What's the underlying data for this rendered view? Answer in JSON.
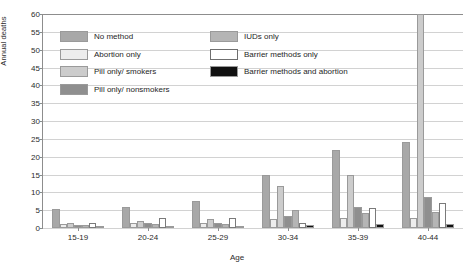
{
  "chart_data": {
    "type": "bar",
    "title": "",
    "xlabel": "Age",
    "ylabel": "Annual deaths",
    "ylim": [
      0,
      60
    ],
    "yticks": [
      0,
      5,
      10,
      15,
      20,
      25,
      30,
      35,
      40,
      45,
      50,
      55,
      60
    ],
    "grid": true,
    "legend_position": "inside-top-left",
    "categories": [
      "15-19",
      "20-24",
      "25-29",
      "30-34",
      "35-39",
      "40-44"
    ],
    "series": [
      {
        "name": "No method",
        "color": "#a8a8a8",
        "values": [
          5.2,
          6.0,
          7.5,
          14.8,
          22.0,
          24.0
        ]
      },
      {
        "name": "Abortion  only",
        "color": "#ededed",
        "values": [
          1.2,
          1.3,
          1.5,
          2.6,
          2.8,
          2.8
        ]
      },
      {
        "name": "Pill only/  smokers",
        "color": "#cccccc",
        "values": [
          1.4,
          2.1,
          2.4,
          11.8,
          15.0,
          60.0
        ]
      },
      {
        "name": "Pill only/ nonsmokers",
        "color": "#8f8f8f",
        "values": [
          0.9,
          1.5,
          1.5,
          3.5,
          6.0,
          8.8
        ]
      },
      {
        "name": "IUDs only",
        "color": "#b5b5b5",
        "values": [
          0.8,
          1.1,
          1.2,
          5.0,
          4.3,
          4.4
        ]
      },
      {
        "name": "Barrier methods  only",
        "color": "#ffffff",
        "values": [
          1.3,
          2.8,
          2.9,
          1.5,
          5.6,
          7.1
        ]
      },
      {
        "name": "Barrier methods and abortion",
        "color": "#111111",
        "values": [
          0.5,
          0.6,
          0.6,
          0.9,
          1.1,
          1.1
        ]
      }
    ]
  }
}
